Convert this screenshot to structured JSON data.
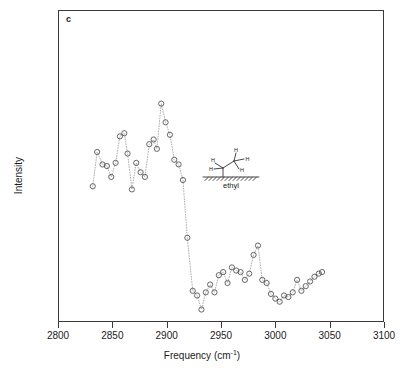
{
  "panel": {
    "label": "c"
  },
  "axes": {
    "xlabel_main": "Frequency (cm",
    "xlabel_sup": "-1",
    "xlabel_close": ")",
    "xlabel_full": "Frequency (cm-1)",
    "ylabel": "Intensity",
    "xticks": [
      "2800",
      "2850",
      "2900",
      "2950",
      "3000",
      "3050",
      "3100"
    ]
  },
  "inset": {
    "caption": "ethyl",
    "atom_labels": [
      "H",
      "H",
      "H",
      "H",
      "H"
    ],
    "surface": "hatched-substrate"
  },
  "colors": {
    "frame": "#3a3a3a",
    "marker": "#555555",
    "connector": "#9a9a9a",
    "background": "#ffffff",
    "text": "#1a1a1a"
  },
  "chart_data": {
    "type": "scatter",
    "title": "",
    "xlabel": "Frequency (cm-1)",
    "ylabel": "Intensity",
    "xlim": [
      2800,
      3100
    ],
    "ylim": [
      0,
      1
    ],
    "grid": false,
    "legend": false,
    "marker": "open-circle",
    "connector": "dotted-line",
    "x": [
      2832,
      2836,
      2841,
      2845,
      2849,
      2853,
      2857,
      2861,
      2864,
      2868,
      2872,
      2876,
      2880,
      2884,
      2888,
      2891,
      2895,
      2899,
      2903,
      2907,
      2911,
      2915,
      2919,
      2924,
      2928,
      2932,
      2936,
      2940,
      2944,
      2948,
      2952,
      2956,
      2960,
      2964,
      2968,
      2972,
      2976,
      2980,
      2984,
      2988,
      2992,
      2996,
      3000,
      3004,
      3008,
      3012,
      3016,
      3020,
      3024,
      3028,
      3032,
      3036,
      3040,
      3043
    ],
    "y": [
      0.435,
      0.545,
      0.505,
      0.5,
      0.465,
      0.51,
      0.595,
      0.605,
      0.54,
      0.425,
      0.51,
      0.48,
      0.465,
      0.57,
      0.585,
      0.555,
      0.7,
      0.64,
      0.6,
      0.52,
      0.505,
      0.455,
      0.27,
      0.1,
      0.085,
      0.04,
      0.095,
      0.12,
      0.095,
      0.15,
      0.16,
      0.125,
      0.175,
      0.165,
      0.16,
      0.135,
      0.155,
      0.215,
      0.245,
      0.135,
      0.125,
      0.09,
      0.075,
      0.065,
      0.085,
      0.08,
      0.095,
      0.135,
      0.1,
      0.115,
      0.13,
      0.145,
      0.155,
      0.16
    ]
  }
}
